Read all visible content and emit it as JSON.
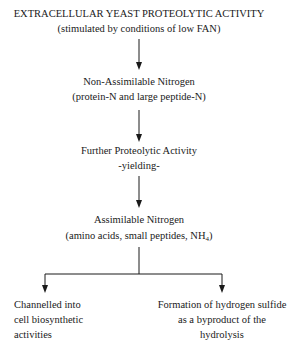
{
  "diagram": {
    "nodes": [
      {
        "id": "n1",
        "line1": "EXTRACELLULAR YEAST PROTEOLYTIC ACTIVITY",
        "line2": "(stimulated by conditions of low FAN)"
      },
      {
        "id": "n2",
        "line1": "Non-Assimilable Nitrogen",
        "line2": "(protein-N and large peptide-N)"
      },
      {
        "id": "n3",
        "line1": "Further Proteolytic Activity",
        "line2": "-yielding-"
      },
      {
        "id": "n4",
        "line1": "Assimilable Nitrogen",
        "line2_prefix": "(amino acids, small peptides, NH",
        "line2_sub": "4",
        "line2_suffix": ")"
      },
      {
        "id": "n5",
        "line1": "Channelled into",
        "line2": "cell biosynthetic",
        "line3": "activities"
      },
      {
        "id": "n6",
        "line1": "Formation of hydrogen sulfide",
        "line2": "as a byproduct of the",
        "line3": "hydrolysis"
      }
    ],
    "edges": [
      {
        "from": "n1",
        "to": "n2"
      },
      {
        "from": "n2",
        "to": "n3"
      },
      {
        "from": "n3",
        "to": "n4"
      },
      {
        "from": "n4",
        "to": "n5"
      },
      {
        "from": "n4",
        "to": "n6"
      }
    ],
    "line_color": "#1a1a1a"
  }
}
